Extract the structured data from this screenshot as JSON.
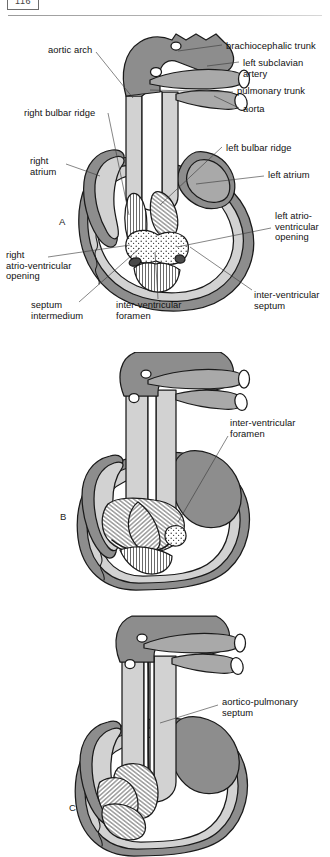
{
  "header": {
    "folio": "116",
    "rule": true
  },
  "figure": {
    "caption_letters": [
      "A",
      "B",
      "C"
    ],
    "colors": {
      "dark_gray": "#8d8d8d",
      "mid_gray": "#a9a9a9",
      "light_gray": "#d2d2d2",
      "pale_gray": "#e6e6e6",
      "outline": "#1a1a1a",
      "white": "#ffffff",
      "leader": "#3b3b3b"
    }
  },
  "panels": [
    {
      "letter": "A",
      "letter_pos": {
        "x": 59,
        "y": 216
      },
      "labels": [
        {
          "name": "aortic-arch",
          "text": "aortic arch",
          "x": 48,
          "y": 45,
          "align": "left"
        },
        {
          "name": "brachiocephalic-trunk",
          "text": "brachiocephalic trunk",
          "x": 226,
          "y": 41,
          "align": "left"
        },
        {
          "name": "left-subclavian-artery",
          "text": "left subclavian\nartery",
          "x": 243,
          "y": 58,
          "align": "left"
        },
        {
          "name": "pulmonary-trunk",
          "text": "pulmonary trunk",
          "x": 237,
          "y": 89,
          "align": "left"
        },
        {
          "name": "aorta",
          "text": "aorta",
          "x": 243,
          "y": 111,
          "align": "left"
        },
        {
          "name": "right-bulbar-ridge",
          "text": "right bulbar ridge",
          "x": 24,
          "y": 110,
          "align": "left"
        },
        {
          "name": "left-bulbar-ridge",
          "text": "left bulbar ridge",
          "x": 226,
          "y": 143,
          "align": "left"
        },
        {
          "name": "right-atrium",
          "text": "right\natrium",
          "x": 30,
          "y": 159,
          "align": "left"
        },
        {
          "name": "left-atrium",
          "text": "left atrium",
          "x": 268,
          "y": 173,
          "align": "left"
        },
        {
          "name": "left-atrio-ventricular-opening",
          "text": "left atrio-\nventricular\nopening",
          "x": 275,
          "y": 216,
          "align": "left"
        },
        {
          "name": "right-atrio-ventricular-opening",
          "text": "right\natrio-ventricular\nopening",
          "x": 6,
          "y": 253,
          "align": "left"
        },
        {
          "name": "septum-intermedium",
          "text": "septum\nintermedium",
          "x": 31,
          "y": 303,
          "align": "left"
        },
        {
          "name": "inter-ventricular-foramen",
          "text": "inter-ventricular\nforamen",
          "x": 116,
          "y": 302,
          "align": "left"
        },
        {
          "name": "inter-ventricular-septum",
          "text": "inter-ventricular\nseptum",
          "x": 254,
          "y": 293,
          "align": "left"
        }
      ],
      "leaders": [
        {
          "name": "leader-aortic-arch",
          "x1": 96,
          "y1": 52,
          "x2": 133,
          "y2": 98
        },
        {
          "name": "leader-brachiocephalic-trunk",
          "x1": 222,
          "y1": 45,
          "x2": 178,
          "y2": 51
        },
        {
          "name": "leader-left-subclavian-artery",
          "x1": 239,
          "y1": 62,
          "x2": 207,
          "y2": 66
        },
        {
          "name": "leader-pulmonary-trunk",
          "x1": 233,
          "y1": 92,
          "x2": 150,
          "y2": 90
        },
        {
          "name": "leader-aorta",
          "x1": 239,
          "y1": 108,
          "x2": 214,
          "y2": 96
        },
        {
          "name": "leader-right-bulbar-ridge",
          "x1": 108,
          "y1": 113,
          "x2": 129,
          "y2": 215
        },
        {
          "name": "leader-left-bulbar-ridge",
          "x1": 222,
          "y1": 147,
          "x2": 160,
          "y2": 205
        },
        {
          "name": "leader-right-atrium",
          "x1": 66,
          "y1": 164,
          "x2": 100,
          "y2": 176
        },
        {
          "name": "leader-left-atrium",
          "x1": 264,
          "y1": 176,
          "x2": 196,
          "y2": 184
        },
        {
          "name": "leader-left-atrio-ventricular-opening",
          "x1": 271,
          "y1": 228,
          "x2": 177,
          "y2": 247
        },
        {
          "name": "leader-right-atrio-ventricular-opening",
          "x1": 48,
          "y1": 257,
          "x2": 130,
          "y2": 245
        },
        {
          "name": "leader-septum-intermedium",
          "x1": 79,
          "y1": 302,
          "x2": 140,
          "y2": 248
        },
        {
          "name": "leader-inter-ventricular-foramen",
          "x1": 158,
          "y1": 299,
          "x2": 155,
          "y2": 252
        },
        {
          "name": "leader-inter-ventricular-septum",
          "x1": 252,
          "y1": 290,
          "x2": 190,
          "y2": 247
        }
      ]
    },
    {
      "letter": "B",
      "letter_pos": {
        "x": 60,
        "y": 511
      },
      "labels": [
        {
          "name": "inter-ventricular-foramen-b",
          "text": "inter-ventricular\nforamen",
          "x": 230,
          "y": 421,
          "align": "left"
        }
      ],
      "leaders": [
        {
          "name": "leader-inter-ventricular-foramen-b",
          "x1": 228,
          "y1": 436,
          "x2": 178,
          "y2": 522
        }
      ]
    },
    {
      "letter": "C",
      "letter_pos": {
        "x": 69,
        "y": 802
      },
      "labels": [
        {
          "name": "aortico-pulmonary-septum",
          "text": "aortico-pulmonary\nseptum",
          "x": 222,
          "y": 700,
          "align": "left"
        }
      ],
      "leaders": [
        {
          "name": "leader-aortico-pulmonary-septum",
          "x1": 218,
          "y1": 705,
          "x2": 160,
          "y2": 723
        }
      ]
    }
  ]
}
